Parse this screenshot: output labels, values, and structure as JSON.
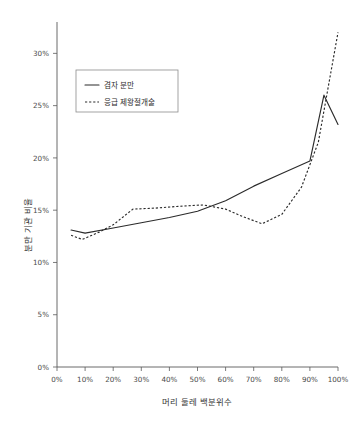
{
  "chart_data": {
    "type": "line",
    "title": "",
    "subtitle": "",
    "xlabel": "머리 둘레 백분위수",
    "ylabel": "분만 기관 비율",
    "xlim": [
      0,
      100
    ],
    "ylim": [
      0,
      33
    ],
    "grid": false,
    "legend_position": "upper-left-inside",
    "background_color": "#ffffff",
    "line_color": "#2b2b2b",
    "x_tick_labels": [
      "0%",
      "10%",
      "20%",
      "30%",
      "40%",
      "50%",
      "60%",
      "70%",
      "80%",
      "90%",
      "100%"
    ],
    "x_tick_values": [
      0,
      10,
      20,
      30,
      40,
      50,
      60,
      70,
      80,
      90,
      100
    ],
    "y_tick_labels": [
      "0%",
      "5%",
      "10%",
      "15%",
      "20%",
      "25%",
      "30%"
    ],
    "y_tick_values": [
      0,
      5,
      10,
      15,
      20,
      25,
      30
    ],
    "series": [
      {
        "name": "겸자 분만",
        "style": "solid",
        "x": [
          5,
          10,
          20,
          30,
          40,
          50,
          60,
          70,
          80,
          90,
          95,
          100
        ],
        "values": [
          13.1,
          12.8,
          13.3,
          13.8,
          14.3,
          14.9,
          15.9,
          17.3,
          18.5,
          19.7,
          26.0,
          23.2
        ]
      },
      {
        "name": "응급 제왕절개술",
        "style": "dotted",
        "x": [
          5,
          9,
          15,
          20,
          27,
          35,
          45,
          52,
          60,
          66,
          73,
          80,
          87,
          93,
          100
        ],
        "values": [
          12.6,
          12.2,
          12.9,
          13.6,
          15.1,
          15.2,
          15.4,
          15.5,
          15.1,
          14.4,
          13.7,
          14.6,
          17.2,
          21.5,
          32.0
        ]
      }
    ]
  },
  "legend": {
    "entries": [
      {
        "label": "겸자 분만",
        "marker": "solid-line-marker"
      },
      {
        "label": "응급 제왕절개술",
        "marker": "dotted-line-marker"
      }
    ]
  }
}
